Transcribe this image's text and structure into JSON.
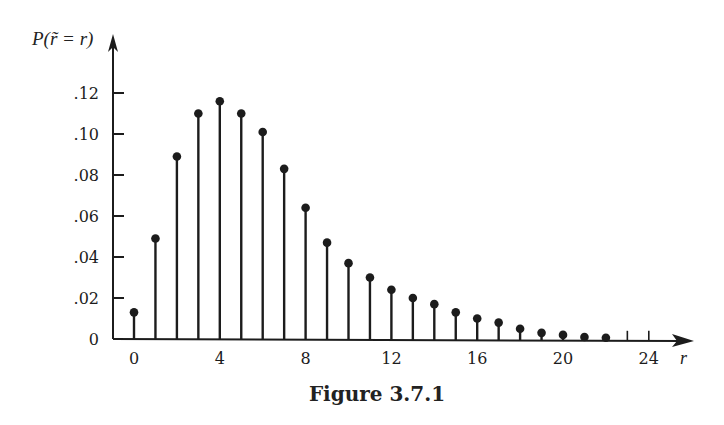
{
  "chart_data": {
    "type": "stem",
    "title": "",
    "caption": "Figure 3.7.1",
    "xlabel": "r",
    "ylabel": "P(r̃ = r)",
    "x": [
      0,
      1,
      2,
      3,
      4,
      5,
      6,
      7,
      8,
      9,
      10,
      11,
      12,
      13,
      14,
      15,
      16,
      17,
      18,
      19,
      20,
      21,
      22
    ],
    "values": [
      0.013,
      0.049,
      0.089,
      0.11,
      0.116,
      0.11,
      0.101,
      0.083,
      0.064,
      0.047,
      0.037,
      0.03,
      0.024,
      0.02,
      0.017,
      0.013,
      0.01,
      0.008,
      0.005,
      0.003,
      0.002,
      0.001,
      0.0005
    ],
    "xticks": [
      0,
      4,
      8,
      12,
      16,
      20,
      24
    ],
    "xtick_labels": [
      "0",
      "4",
      "8",
      "12",
      "16",
      "20",
      "24"
    ],
    "minor_xticks": [
      23,
      24
    ],
    "yticks": [
      0,
      0.02,
      0.04,
      0.06,
      0.08,
      0.1,
      0.12
    ],
    "ytick_labels": [
      "0",
      ".02",
      ".04",
      ".06",
      ".08",
      ".10",
      ".12"
    ],
    "xlim": [
      0,
      24
    ],
    "ylim": [
      0,
      0.13
    ],
    "grid": false,
    "legend": null
  },
  "figure": {
    "caption": "Figure 3.7.1",
    "ylabel": "P(r̃ = r)"
  }
}
